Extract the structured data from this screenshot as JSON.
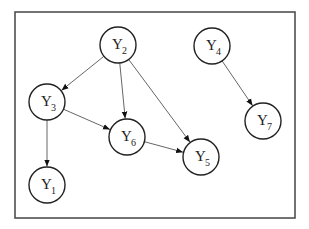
{
  "diagram": {
    "type": "directed-acyclic-graph",
    "frame": {
      "x": 15,
      "y": 12,
      "width": 280,
      "height": 206
    },
    "node_radius": 18,
    "nodes": [
      {
        "id": "Y1",
        "base": "Y",
        "sub": "1",
        "x": 47,
        "y": 185
      },
      {
        "id": "Y2",
        "base": "Y",
        "sub": "2",
        "x": 118,
        "y": 45
      },
      {
        "id": "Y3",
        "base": "Y",
        "sub": "3",
        "x": 47,
        "y": 102
      },
      {
        "id": "Y4",
        "base": "Y",
        "sub": "4",
        "x": 212,
        "y": 46
      },
      {
        "id": "Y5",
        "base": "Y",
        "sub": "5",
        "x": 201,
        "y": 157
      },
      {
        "id": "Y6",
        "base": "Y",
        "sub": "6",
        "x": 127,
        "y": 137
      },
      {
        "id": "Y7",
        "base": "Y",
        "sub": "7",
        "x": 263,
        "y": 121
      }
    ],
    "edges": [
      {
        "from": "Y2",
        "to": "Y3"
      },
      {
        "from": "Y2",
        "to": "Y6"
      },
      {
        "from": "Y2",
        "to": "Y5"
      },
      {
        "from": "Y3",
        "to": "Y6"
      },
      {
        "from": "Y3",
        "to": "Y1"
      },
      {
        "from": "Y6",
        "to": "Y5"
      },
      {
        "from": "Y4",
        "to": "Y7"
      }
    ]
  }
}
